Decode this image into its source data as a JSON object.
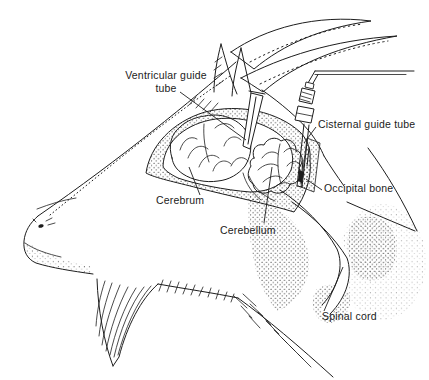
{
  "labels": {
    "ventricular_guide_tube": "Ventricular guide\ntube",
    "cisternal_guide_tube": "Cisternal guide tube",
    "occipital_bone": "Occipital bone",
    "cerebrum": "Cerebrum",
    "cerebellum": "Cerebellum",
    "spinal_cord": "Spinal cord"
  },
  "colors": {
    "ink": "#1d1d1d",
    "paper": "#ffffff"
  }
}
